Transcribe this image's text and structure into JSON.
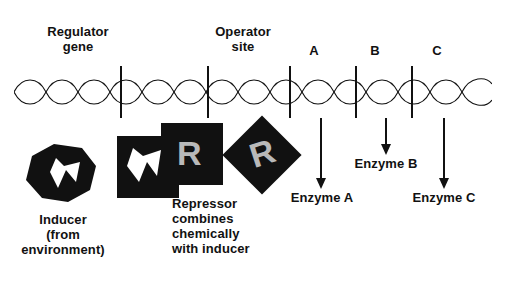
{
  "diagram": {
    "title_labels": {
      "regulator_gene": "Regulator\ngene",
      "operator_site": "Operator\nsite",
      "gene_a": "A",
      "gene_b": "B",
      "gene_c": "C"
    },
    "product_labels": {
      "enzyme_a": "Enzyme A",
      "enzyme_b": "Enzyme B",
      "enzyme_c": "Enzyme C"
    },
    "bottom_labels": {
      "inducer": "Inducer\n(from\nenvironment)",
      "repressor": "Repressor\ncombines\nchemically\nwith inducer"
    },
    "shape_letters": {
      "repressor_free": "R",
      "repressor_bound": "R"
    },
    "colors": {
      "ink": "#111111",
      "letter_gray": "#b9b9b9",
      "background": "#ffffff"
    }
  }
}
